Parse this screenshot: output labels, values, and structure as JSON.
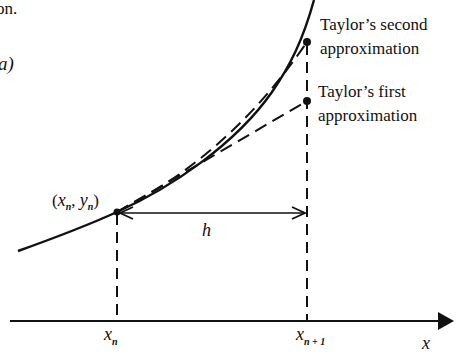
{
  "fragment_text": {
    "top_line": "on.",
    "left_line": "a)"
  },
  "diagram": {
    "point_label": {
      "open": "(",
      "x": "x",
      "x_sub": "n",
      "sep": ", ",
      "y": "y",
      "y_sub": "n",
      "close": ")"
    },
    "step_label": "h",
    "axis_label": "x",
    "tick_labels": [
      {
        "main": "x",
        "sub": "n"
      },
      {
        "main": "x",
        "sub": "n + 1"
      }
    ],
    "annotations": {
      "second_line1": "Taylor’s second",
      "second_line2": "approximation",
      "first_line1": "Taylor’s first",
      "first_line2": "approximation"
    },
    "colors": {
      "ink": "#111111",
      "background": "#ffffff"
    }
  }
}
